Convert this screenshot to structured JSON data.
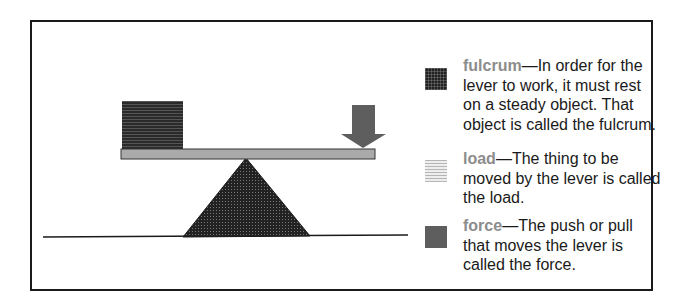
{
  "diagram": {
    "colors": {
      "border": "#1a1a1a",
      "term": "#8c8c8c",
      "fulcrum": "#222222",
      "load": "#2a2a2a",
      "plank": "#aaaaaa",
      "force": "#5e5e5e"
    }
  },
  "legend": [
    {
      "term": "fulcrum",
      "dash": "—",
      "definition": "In order for the lever to work, it must rest on a steady object. That object is called the fulcrum."
    },
    {
      "term": "load",
      "dash": "—",
      "definition": "The thing to be moved by the lever is called the load."
    },
    {
      "term": "force",
      "dash": "—",
      "definition": "The push or pull that moves the lever is called the force."
    }
  ]
}
